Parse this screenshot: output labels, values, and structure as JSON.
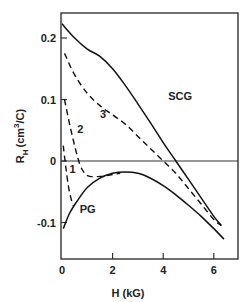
{
  "chart_data": {
    "type": "line",
    "title": "",
    "xlabel": "H (kG)",
    "ylabel": "R_H (cm^3/C)",
    "xlim": [
      0,
      6.9
    ],
    "ylim": [
      -0.16,
      0.24
    ],
    "x_ticks": [
      "0",
      "2",
      "4",
      "6"
    ],
    "y_ticks": [
      "0.2",
      "0.1",
      "0",
      "-0.1"
    ],
    "grid": false,
    "legend": "none (curves labeled inline)",
    "series": [
      {
        "name": "SCG",
        "style": "solid",
        "x": [
          0,
          0.5,
          1.0,
          1.5,
          2.0,
          2.5,
          3.0,
          3.5,
          4.0,
          4.5,
          5.0,
          5.5,
          6.0,
          6.3
        ],
        "y": [
          0.223,
          0.2,
          0.182,
          0.17,
          0.15,
          0.123,
          0.093,
          0.062,
          0.03,
          0.0,
          -0.03,
          -0.06,
          -0.09,
          -0.105
        ]
      },
      {
        "name": "3",
        "style": "dashed",
        "x": [
          0.1,
          0.5,
          1.0,
          1.5,
          2.0,
          2.5,
          3.0,
          3.5,
          4.0,
          4.5,
          5.0,
          5.5,
          6.0,
          6.3
        ],
        "y": [
          0.175,
          0.14,
          0.11,
          0.09,
          0.075,
          0.06,
          0.04,
          0.02,
          0.0,
          -0.02,
          -0.045,
          -0.07,
          -0.095,
          -0.105
        ]
      },
      {
        "name": "2",
        "style": "dashed",
        "x": [
          0.1,
          0.3,
          0.5,
          0.7,
          0.9,
          1.1,
          1.5,
          2.0,
          2.3
        ],
        "y": [
          0.1,
          0.06,
          0.025,
          -0.005,
          -0.02,
          -0.025,
          -0.025,
          -0.022,
          -0.02
        ]
      },
      {
        "name": "1",
        "style": "dashed",
        "x": [
          0.05,
          0.15,
          0.25,
          0.35,
          0.45
        ],
        "y": [
          0.025,
          -0.01,
          -0.04,
          -0.06,
          -0.073
        ]
      },
      {
        "name": "PG",
        "style": "solid",
        "x": [
          0.05,
          0.3,
          0.6,
          1.0,
          1.5,
          2.0,
          2.5,
          3.0,
          3.5,
          4.0,
          4.5,
          5.0,
          5.5,
          6.0,
          6.4
        ],
        "y": [
          -0.11,
          -0.085,
          -0.065,
          -0.043,
          -0.028,
          -0.02,
          -0.018,
          -0.02,
          -0.028,
          -0.04,
          -0.055,
          -0.072,
          -0.09,
          -0.11,
          -0.127
        ]
      }
    ],
    "annotations": [
      {
        "text": "SCG",
        "x": 4.2,
        "y": 0.1
      },
      {
        "text": "3",
        "x": 1.5,
        "y": 0.07
      },
      {
        "text": "2",
        "x": 0.6,
        "y": 0.045
      },
      {
        "text": "1",
        "x": 0.3,
        "y": -0.02
      },
      {
        "text": "PG",
        "x": 0.7,
        "y": -0.085
      }
    ]
  },
  "labels": {
    "x_axis": "H (kG)",
    "y_axis_main": "R",
    "y_axis_sub": "H",
    "y_axis_units": "(cm",
    "y_axis_sup": "3",
    "y_axis_units_end": "/C)"
  }
}
